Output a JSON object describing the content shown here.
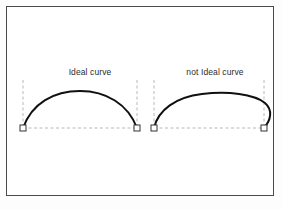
{
  "figure": {
    "background_color": "#ffffff",
    "page_background_color": "#fdfdfd",
    "border_color": "#4a4a4a",
    "curve_color": "#101010",
    "guide_color": "#b8b8b8",
    "marker_fill": "#ffffff",
    "marker_stroke": "#333333",
    "bottom_clipped_text": "",
    "panels": [
      {
        "id": "ideal",
        "label": "Ideal curve",
        "label_x": 83,
        "label_y": 66,
        "quality": "ideal",
        "baseline_y": 122,
        "start_point": {
          "x": 17,
          "y": 122
        },
        "end_point": {
          "x": 131,
          "y": 122
        },
        "apex": {
          "x": 74,
          "y": 85
        },
        "overshoot": false,
        "guide_top_y": 74,
        "curve_path": "M 17 122 C 26 97, 48 85, 74 85 C 100 85, 122 98, 131 122",
        "description": "symmetric arch rising from the left marker to an apex at mid-span and descending to the right marker"
      },
      {
        "id": "not-ideal",
        "label": "not Ideal curve",
        "label_x": 208,
        "label_y": 66,
        "quality": "not-ideal",
        "baseline_y": 122,
        "start_point": {
          "x": 148,
          "y": 122
        },
        "end_point": {
          "x": 258,
          "y": 122
        },
        "apex": {
          "x": 212,
          "y": 87
        },
        "overshoot": true,
        "guide_top_y": 74,
        "curve_path": "M 148 122 C 152 104, 170 91, 196 88 C 222 85, 248 88, 259 97 C 267 104, 265 114, 258 122",
        "description": "asymmetric arch that climbs steeply, peaks right of centre, overshoots beyond the right guide line and hooks back down to the marker"
      }
    ],
    "markers": [
      {
        "name": "ideal-start-marker",
        "x": 17,
        "y": 122
      },
      {
        "name": "ideal-end-marker",
        "x": 131,
        "y": 122
      },
      {
        "name": "not-ideal-start-marker",
        "x": 148,
        "y": 122
      },
      {
        "name": "not-ideal-end-marker",
        "x": 258,
        "y": 122
      }
    ],
    "guides": {
      "vertical": [
        {
          "name": "ideal-start-guide",
          "x": 17,
          "y1": 74,
          "y2": 122
        },
        {
          "name": "ideal-end-guide",
          "x": 131,
          "y1": 74,
          "y2": 122
        },
        {
          "name": "not-ideal-start-guide",
          "x": 148,
          "y1": 74,
          "y2": 122
        },
        {
          "name": "not-ideal-end-guide",
          "x": 258,
          "y1": 74,
          "y2": 122
        }
      ],
      "horizontal": [
        {
          "name": "ideal-baseline",
          "x1": 17,
          "x2": 131,
          "y": 122
        },
        {
          "name": "not-ideal-baseline",
          "x1": 148,
          "x2": 258,
          "y": 122
        }
      ]
    }
  }
}
